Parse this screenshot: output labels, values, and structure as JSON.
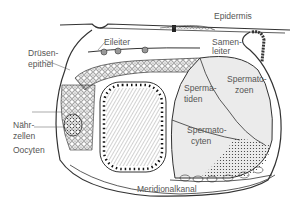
{
  "diagram": {
    "labels": {
      "epidermis": "Epidermis",
      "eileiter": "Eileiter",
      "samenleiter_1": "Samen-",
      "samenleiter_2": "leiter",
      "druesen_1": "Drüsen-",
      "druesen_2": "epithel",
      "spermatiden_1": "Sperma-",
      "spermatiden_2": "tiden",
      "spermatozoen_1": "Spermato-",
      "spermatozoen_2": "zoen",
      "naehr_1": "Nähr-",
      "naehr_2": "zellen",
      "oocyten": "Oocyten",
      "spermatocyten_1": "Spermato-",
      "spermatocyten_2": "cyten",
      "meridional": "Meridionalkanal"
    },
    "colors": {
      "line": "#333333",
      "fill_light": "#ebebeb",
      "label": "#555555"
    }
  }
}
